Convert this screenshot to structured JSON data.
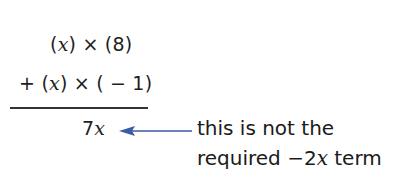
{
  "working": {
    "line1": {
      "open1": "(",
      "var1": "x",
      "close1": ")",
      "op": " × ",
      "operand2": "(8)"
    },
    "line2": {
      "sign": "+ ",
      "open1": "(",
      "var1": "x",
      "close1": ")",
      "op": " × ",
      "operand2": "( − 1)"
    },
    "result": {
      "coef": "7",
      "var": "x"
    }
  },
  "annotation": {
    "line1": "this is not the",
    "line2_prefix": "required ",
    "line2_term_coef": "−2",
    "line2_term_var": "x",
    "line2_suffix": " term",
    "arrow_color": "#3b5ba5"
  }
}
